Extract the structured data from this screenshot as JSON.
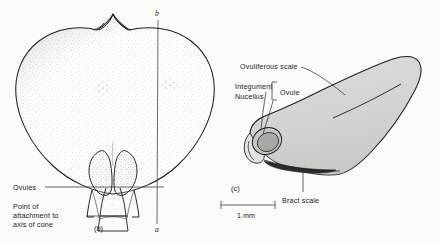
{
  "figure": {
    "kind": "botanical-line-drawing",
    "background_color": "#fbfbfa",
    "ink_color": "#1d1d22",
    "panels": [
      {
        "id": "b",
        "label": "(b)",
        "description": "outer face of cone scale with two ovules",
        "labels": [
          {
            "name": "ovules",
            "text": "Ovules"
          },
          {
            "name": "point-of-attachment",
            "lines": [
              "Point of",
              "attachment to",
              "axis of cone"
            ]
          }
        ],
        "axis_markers": {
          "top": "b",
          "bottom": "a"
        }
      },
      {
        "id": "c",
        "label": "(c)",
        "description": "longitudinal section of ovuliferous scale with ovule and bract scale",
        "labels": [
          {
            "name": "ovuliferous-scale",
            "text": "Ovuliferous scale"
          },
          {
            "name": "integument",
            "text": "Integument"
          },
          {
            "name": "nucellus",
            "text": "Nucellus"
          },
          {
            "name": "ovule",
            "text": "Ovule"
          },
          {
            "name": "bract-scale",
            "text": "Bract scale"
          }
        ],
        "scale_bar": {
          "text": "1 mm"
        }
      }
    ],
    "colors": {
      "scale_fill": "#d5d5d3",
      "integument_fill": "#c2c2be",
      "nucellus_fill": "#a9a9a4",
      "bract_fill": "#2b2b2b",
      "stipple": "#4a4a50"
    }
  }
}
